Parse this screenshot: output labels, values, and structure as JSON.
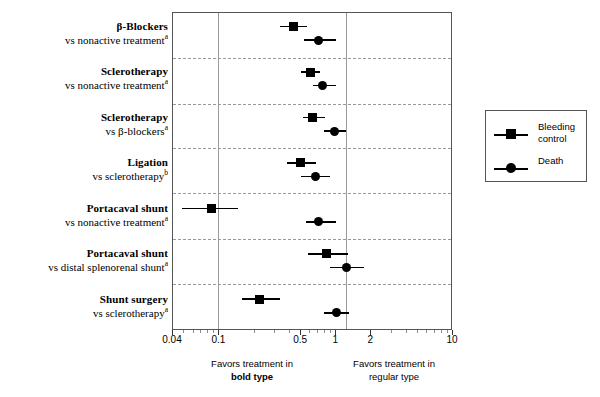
{
  "chart_data": {
    "type": "scatter",
    "title": "",
    "xlabel": "Odds ratio (log scale)",
    "ylabel": "",
    "xscale": "log",
    "xlim": [
      0.04,
      10
    ],
    "grid": false,
    "reference_line": 1,
    "tick_values": [
      0.04,
      0.1,
      0.5,
      1,
      2,
      10
    ],
    "tick_labels": [
      "0.04",
      "0.1",
      "0.5",
      "1",
      "2",
      "10"
    ],
    "legend_position": "right-outside",
    "legend": [
      "Bleeding control",
      "Death"
    ],
    "footer_left": {
      "line1": "Favors treatment in",
      "line2": "bold type"
    },
    "footer_right": {
      "line1": "Favors treatment in",
      "line2": "regular type"
    },
    "series": [
      {
        "name": "Bleeding control",
        "marker": "square",
        "values": [
          {
            "row": 0,
            "estimate": 0.43,
            "ci_low": 0.33,
            "ci_high": 0.56
          },
          {
            "row": 1,
            "estimate": 0.6,
            "ci_low": 0.5,
            "ci_high": 0.73
          },
          {
            "row": 2,
            "estimate": 0.63,
            "ci_low": 0.52,
            "ci_high": 0.8
          },
          {
            "row": 3,
            "estimate": 0.49,
            "ci_low": 0.38,
            "ci_high": 0.67
          },
          {
            "row": 4,
            "estimate": 0.085,
            "ci_low": 0.048,
            "ci_high": 0.145
          },
          {
            "row": 5,
            "estimate": 0.83,
            "ci_low": 0.57,
            "ci_high": 1.25
          },
          {
            "row": 6,
            "estimate": 0.22,
            "ci_low": 0.155,
            "ci_high": 0.33
          }
        ]
      },
      {
        "name": "Death",
        "marker": "circle",
        "values": [
          {
            "row": 0,
            "estimate": 0.7,
            "ci_low": 0.53,
            "ci_high": 1.0
          },
          {
            "row": 1,
            "estimate": 0.76,
            "ci_low": 0.63,
            "ci_high": 1.0
          },
          {
            "row": 2,
            "estimate": 0.97,
            "ci_low": 0.78,
            "ci_high": 1.22
          },
          {
            "row": 3,
            "estimate": 0.67,
            "ci_low": 0.5,
            "ci_high": 0.89
          },
          {
            "row": 4,
            "estimate": 0.71,
            "ci_low": 0.55,
            "ci_high": 1.0
          },
          {
            "row": 5,
            "estimate": 1.22,
            "ci_low": 0.88,
            "ci_high": 1.72
          },
          {
            "row": 6,
            "estimate": 1.0,
            "ci_low": 0.78,
            "ci_high": 1.28
          }
        ]
      }
    ],
    "rows": [
      {
        "treatment": "β-Blockers",
        "comparator": "vs nonactive treatment",
        "footnote": "a"
      },
      {
        "treatment": "Sclerotherapy",
        "comparator": "vs nonactive treatment",
        "footnote": "a"
      },
      {
        "treatment": "Sclerotherapy",
        "comparator": "vs β-blockers",
        "footnote": "a"
      },
      {
        "treatment": "Ligation",
        "comparator": "vs sclerotherapy",
        "footnote": "b"
      },
      {
        "treatment": "Portacaval shunt",
        "comparator": "vs nonactive treatment",
        "footnote": "a"
      },
      {
        "treatment": "Portacaval shunt",
        "comparator": "vs distal splenorenal shunt",
        "footnote": "a"
      },
      {
        "treatment": "Shunt surgery",
        "comparator": "vs sclerotherapy",
        "footnote": "a"
      }
    ]
  },
  "legend": {
    "items": [
      {
        "label_line1": "Bleeding",
        "label_line2": "control",
        "marker": "square"
      },
      {
        "label_line1": "Death",
        "label_line2": "",
        "marker": "circle"
      }
    ]
  },
  "axis": {
    "labels": [
      "0.04",
      "0.1",
      "0.5",
      "1",
      "2",
      "10"
    ]
  },
  "footers": {
    "left_line1": "Favors treatment in",
    "left_line2": "bold type",
    "right_line1": "Favors treatment in",
    "right_line2": "regular type"
  },
  "colors": {
    "marker": "#000000",
    "frame": "#555555",
    "separator": "#9a9a9a",
    "reference_line": "#9a9a9a",
    "background": "#ffffff"
  }
}
